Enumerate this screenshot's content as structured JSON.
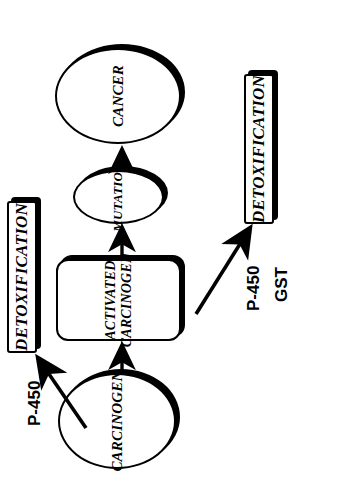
{
  "diagram": {
    "orientation": "rotated-90-counterclockwise",
    "colors": {
      "background": "#ffffff",
      "stroke": "#000000",
      "shadow": "#000000",
      "text": "#000000"
    },
    "nodes": [
      {
        "id": "carcinogen",
        "label": "CARCINOGEN",
        "shape": "ellipse"
      },
      {
        "id": "activated-carcinogen",
        "label": "ACTIVATED\nCARCINOGEN",
        "shape": "rounded-rect"
      },
      {
        "id": "mutation",
        "label": "MUTATION",
        "shape": "ellipse"
      },
      {
        "id": "cancer",
        "label": "CANCER",
        "shape": "ellipse"
      },
      {
        "id": "detoxification-top",
        "label": "DETOXIFICATION",
        "shape": "bar"
      },
      {
        "id": "detoxification-bottom",
        "label": "DETOXIFICATION",
        "shape": "bar"
      }
    ],
    "enzyme_labels": [
      {
        "id": "enzyme-p450-top",
        "text": "P-450"
      },
      {
        "id": "enzyme-p450-bottom",
        "text": "P-450"
      },
      {
        "id": "enzyme-gst",
        "text": "GST"
      }
    ],
    "edges": [
      {
        "from": "carcinogen",
        "to": "activated-carcinogen",
        "style": "straight-arrow"
      },
      {
        "from": "activated-carcinogen",
        "to": "mutation",
        "style": "straight-arrow"
      },
      {
        "from": "mutation",
        "to": "cancer",
        "style": "straight-arrow"
      },
      {
        "from": "carcinogen",
        "to": "detoxification-top",
        "style": "diagonal-arrow",
        "enzyme": "P-450"
      },
      {
        "from": "activated-carcinogen",
        "to": "detoxification-bottom",
        "style": "diagonal-arrow",
        "enzyme": "P-450 / GST"
      }
    ]
  }
}
